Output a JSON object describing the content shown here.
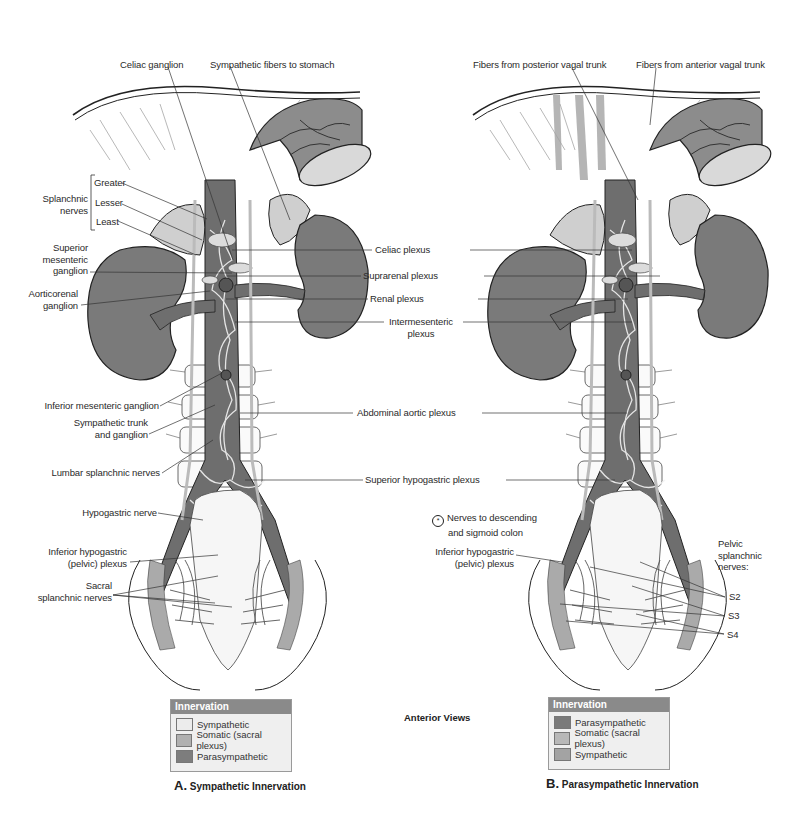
{
  "colors": {
    "sympathetic_fill": "#e8e8e8",
    "somatic_fill": "#a8a8a8",
    "parasympathetic_fill": "#6e6e6e",
    "kidney": "#7a7a7a",
    "adrenal": "#cfcfcf",
    "legend_header": "#8a8a8a",
    "legend_bg": "#efefef"
  },
  "center": {
    "title": "Anterior Views",
    "labels": {
      "celiac_plexus": "Celiac plexus",
      "suprarenal_plexus": "Suprarenal plexus",
      "renal_plexus": "Renal plexus",
      "intermesenteric_plexus_1": "Intermesenteric",
      "intermesenteric_plexus_2": "plexus",
      "abdominal_aortic_plexus": "Abdominal aortic plexus",
      "superior_hypogastric_plexus": "Superior hypogastric plexus"
    }
  },
  "panel_a": {
    "caption_letter": "A.",
    "caption_text": "Sympathetic Innervation",
    "labels": {
      "celiac_ganglion": "Celiac ganglion",
      "sympathetic_fibers_to_stomach": "Sympathetic fibers to stomach",
      "splanchnic_nerves_1": "Splanchnic",
      "splanchnic_nerves_2": "nerves",
      "greater": "Greater",
      "lesser": "Lesser",
      "least": "Least",
      "superior_mesenteric_ganglion_1": "Superior",
      "superior_mesenteric_ganglion_2": "mesenteric",
      "superior_mesenteric_ganglion_3": "ganglion",
      "aorticorenal_ganglion_1": "Aorticorenal",
      "aorticorenal_ganglion_2": "ganglion",
      "inferior_mesenteric_ganglion": "Inferior mesenteric ganglion",
      "sympathetic_trunk_1": "Sympathetic trunk",
      "sympathetic_trunk_2": "and ganglion",
      "lumbar_splanchnic_nerves": "Lumbar splanchnic nerves",
      "hypogastric_nerve": "Hypogastric nerve",
      "inferior_hypogastric_1": "Inferior hypogastric",
      "inferior_hypogastric_2": "(pelvic) plexus",
      "sacral_splanchnic_1": "Sacral",
      "sacral_splanchnic_2": "splanchnic nerves"
    },
    "legend": {
      "title": "Innervation",
      "items": [
        {
          "label": "Sympathetic",
          "color": "#ececec"
        },
        {
          "label": "Somatic (sacral plexus)",
          "color": "#b0b0b0"
        },
        {
          "label": "Parasympathetic",
          "color": "#7d7d7d"
        }
      ]
    }
  },
  "panel_b": {
    "caption_letter": "B.",
    "caption_text": "Parasympathetic Innervation",
    "labels": {
      "fibers_posterior_vagal": "Fibers from posterior vagal trunk",
      "fibers_anterior_vagal": "Fibers from anterior vagal trunk",
      "nerves_to_colon_symbol": "*",
      "nerves_to_colon_1": "Nerves to descending",
      "nerves_to_colon_2": "and sigmoid colon",
      "inferior_hypogastric_1": "Inferior hypogastric",
      "inferior_hypogastric_2": "(pelvic) plexus",
      "pelvic_splanchnic_1": "Pelvic",
      "pelvic_splanchnic_2": "splanchnic",
      "pelvic_splanchnic_3": "nerves:",
      "s2": "S2",
      "s3": "S3",
      "s4": "S4"
    },
    "legend": {
      "title": "Innervation",
      "items": [
        {
          "label": "Parasympathetic",
          "color": "#7a7a7a"
        },
        {
          "label": "Somatic (sacral plexus)",
          "color": "#b8b8b8"
        },
        {
          "label": "Sympathetic",
          "color": "#a3a3a3"
        }
      ]
    }
  }
}
